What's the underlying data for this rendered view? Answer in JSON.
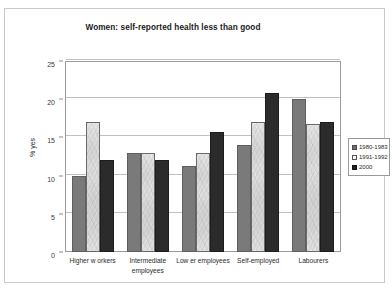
{
  "chart_data": {
    "type": "bar",
    "title": "Women: self-reported health less than good",
    "xlabel": "",
    "ylabel": "% yes",
    "ylim": [
      0,
      25
    ],
    "yticks": [
      0,
      5,
      10,
      15,
      20,
      25
    ],
    "grid": true,
    "legend_position": "right",
    "categories": [
      "Higher w orkers",
      "Intermediate employees",
      "Low er employees",
      "Self-employed",
      "Labourers"
    ],
    "category_lines": [
      [
        "Higher w orkers"
      ],
      [
        "Intermediate",
        "employees"
      ],
      [
        "Low er employees"
      ],
      [
        "Self-employed"
      ],
      [
        "Labourers"
      ]
    ],
    "series": [
      {
        "name": "1980-1983",
        "color": "#7a7a7a",
        "values": [
          10.0,
          13.0,
          11.3,
          14.0,
          20.0
        ]
      },
      {
        "name": "1991-1992",
        "color": "#ffffff",
        "values": [
          17.0,
          13.0,
          13.0,
          17.0,
          16.7
        ]
      },
      {
        "name": "2000",
        "color": "#2b2b2b",
        "values": [
          12.0,
          12.0,
          15.7,
          20.8,
          17.0
        ]
      }
    ]
  }
}
